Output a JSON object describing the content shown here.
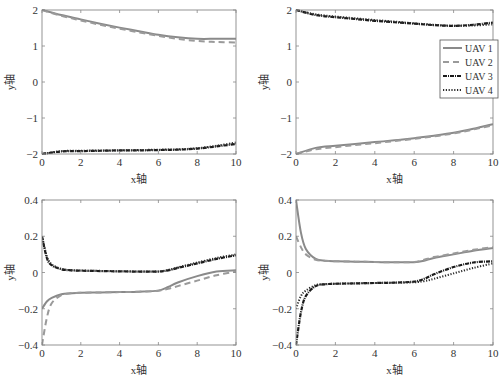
{
  "chart_data": [
    {
      "type": "line",
      "panel": "top-left",
      "xlabel": "x轴",
      "ylabel": "y轴",
      "xlim": [
        0,
        10
      ],
      "ylim": [
        -2,
        2
      ],
      "xticks": [
        0,
        2,
        4,
        6,
        8,
        10
      ],
      "yticks": [
        -2,
        -1,
        0,
        1,
        2
      ],
      "grid": false,
      "x": [
        0,
        1,
        2,
        3,
        4,
        5,
        6,
        7,
        8,
        9,
        10
      ],
      "series": [
        {
          "name": "UAV 1",
          "values": [
            2.0,
            1.86,
            1.74,
            1.62,
            1.51,
            1.41,
            1.31,
            1.24,
            1.2,
            1.2,
            1.2
          ]
        },
        {
          "name": "UAV 2",
          "values": [
            2.0,
            1.84,
            1.71,
            1.59,
            1.48,
            1.38,
            1.28,
            1.2,
            1.14,
            1.11,
            1.1
          ]
        },
        {
          "name": "UAV 3",
          "values": [
            -2.0,
            -1.93,
            -1.92,
            -1.91,
            -1.9,
            -1.9,
            -1.89,
            -1.88,
            -1.85,
            -1.79,
            -1.72
          ]
        },
        {
          "name": "UAV 4",
          "values": [
            -2.0,
            -1.92,
            -1.91,
            -1.9,
            -1.9,
            -1.89,
            -1.88,
            -1.87,
            -1.84,
            -1.77,
            -1.68
          ]
        }
      ]
    },
    {
      "type": "line",
      "panel": "top-right",
      "xlabel": "x轴",
      "ylabel": "y轴",
      "xlim": [
        0,
        10
      ],
      "ylim": [
        -2,
        2
      ],
      "xticks": [
        0,
        2,
        4,
        6,
        8,
        10
      ],
      "yticks": [
        -2,
        -1,
        0,
        1,
        2
      ],
      "grid": false,
      "legend": {
        "position": "right",
        "entries": [
          "UAV 1",
          "UAV 2",
          "UAV 3",
          "UAV 4"
        ]
      },
      "x": [
        0,
        1,
        2,
        3,
        4,
        5,
        6,
        7,
        8,
        9,
        10
      ],
      "series": [
        {
          "name": "UAV 1",
          "values": [
            -2.0,
            -1.83,
            -1.77,
            -1.72,
            -1.67,
            -1.62,
            -1.56,
            -1.49,
            -1.41,
            -1.3,
            -1.17
          ]
        },
        {
          "name": "UAV 2",
          "values": [
            -2.0,
            -1.87,
            -1.81,
            -1.75,
            -1.7,
            -1.64,
            -1.58,
            -1.51,
            -1.43,
            -1.32,
            -1.2
          ]
        },
        {
          "name": "UAV 3",
          "values": [
            2.0,
            1.86,
            1.8,
            1.75,
            1.7,
            1.66,
            1.62,
            1.58,
            1.56,
            1.59,
            1.65
          ]
        },
        {
          "name": "UAV 4",
          "values": [
            2.0,
            1.88,
            1.82,
            1.77,
            1.72,
            1.68,
            1.63,
            1.59,
            1.56,
            1.57,
            1.6
          ]
        }
      ]
    },
    {
      "type": "line",
      "panel": "bottom-left",
      "xlabel": "x轴",
      "ylabel": "y轴",
      "xlim": [
        0,
        10
      ],
      "ylim": [
        -0.4,
        0.4
      ],
      "xticks": [
        0,
        2,
        4,
        6,
        8,
        10
      ],
      "yticks": [
        -0.4,
        -0.2,
        0,
        0.2,
        0.4
      ],
      "grid": false,
      "x": [
        0,
        0.25,
        0.5,
        1,
        1.5,
        2,
        3,
        4,
        5,
        6,
        6.5,
        7,
        8,
        9,
        10
      ],
      "series": [
        {
          "name": "UAV 1",
          "values": [
            -0.2,
            -0.16,
            -0.14,
            -0.12,
            -0.115,
            -0.112,
            -0.11,
            -0.108,
            -0.106,
            -0.1,
            -0.08,
            -0.055,
            -0.02,
            0.005,
            0.012
          ]
        },
        {
          "name": "UAV 2",
          "values": [
            -0.4,
            -0.25,
            -0.17,
            -0.125,
            -0.115,
            -0.112,
            -0.11,
            -0.108,
            -0.106,
            -0.1,
            -0.09,
            -0.075,
            -0.045,
            -0.015,
            0.005
          ]
        },
        {
          "name": "UAV 3",
          "values": [
            0.2,
            0.08,
            0.04,
            0.018,
            0.012,
            0.01,
            0.008,
            0.006,
            0.005,
            0.005,
            0.012,
            0.025,
            0.05,
            0.075,
            0.095
          ]
        },
        {
          "name": "UAV 4",
          "values": [
            0.2,
            0.09,
            0.045,
            0.02,
            0.013,
            0.011,
            0.009,
            0.007,
            0.006,
            0.006,
            0.014,
            0.028,
            0.055,
            0.08,
            0.1
          ]
        }
      ]
    },
    {
      "type": "line",
      "panel": "bottom-right",
      "xlabel": "x轴",
      "ylabel": "y轴",
      "xlim": [
        0,
        10
      ],
      "ylim": [
        -0.4,
        0.4
      ],
      "xticks": [
        0,
        2,
        4,
        6,
        8,
        10
      ],
      "yticks": [
        -0.4,
        -0.2,
        0,
        0.2,
        0.4
      ],
      "grid": false,
      "x": [
        0,
        0.25,
        0.5,
        1,
        1.5,
        2,
        3,
        4,
        5,
        6,
        6.5,
        7,
        8,
        9,
        10
      ],
      "series": [
        {
          "name": "UAV 1",
          "values": [
            0.4,
            0.22,
            0.13,
            0.075,
            0.065,
            0.062,
            0.06,
            0.058,
            0.056,
            0.057,
            0.065,
            0.08,
            0.1,
            0.12,
            0.135
          ]
        },
        {
          "name": "UAV 2",
          "values": [
            0.2,
            0.14,
            0.1,
            0.07,
            0.064,
            0.062,
            0.06,
            0.058,
            0.056,
            0.058,
            0.07,
            0.085,
            0.105,
            0.125,
            0.14
          ]
        },
        {
          "name": "UAV 3",
          "values": [
            -0.4,
            -0.22,
            -0.13,
            -0.075,
            -0.065,
            -0.062,
            -0.06,
            -0.058,
            -0.056,
            -0.05,
            -0.035,
            -0.01,
            0.03,
            0.055,
            0.062
          ]
        },
        {
          "name": "UAV 4",
          "values": [
            -0.2,
            -0.13,
            -0.1,
            -0.07,
            -0.064,
            -0.062,
            -0.06,
            -0.058,
            -0.056,
            -0.054,
            -0.048,
            -0.035,
            -0.005,
            0.025,
            0.05
          ]
        }
      ]
    }
  ],
  "styles": {
    "UAV 1": {
      "color": "#8a8a8a",
      "dash": "",
      "width": 2.0
    },
    "UAV 2": {
      "color": "#9a9a9a",
      "dash": "6,4",
      "width": 2.0
    },
    "UAV 3": {
      "color": "#1a1a1a",
      "dash": "4,1,1,1",
      "width": 2.2
    },
    "UAV 4": {
      "color": "#2a2a2a",
      "dash": "1.2,1.6",
      "width": 2.0
    }
  },
  "layout": {
    "panels": [
      {
        "left": 42,
        "top": 10,
        "right": 236,
        "bottom": 154
      },
      {
        "left": 296,
        "top": 10,
        "right": 493,
        "bottom": 154
      },
      {
        "left": 42,
        "top": 200,
        "right": 236,
        "bottom": 345
      },
      {
        "left": 296,
        "top": 200,
        "right": 493,
        "bottom": 345
      }
    ],
    "legend_box": {
      "left": 440,
      "top": 40,
      "width": 58,
      "height": 58
    }
  }
}
